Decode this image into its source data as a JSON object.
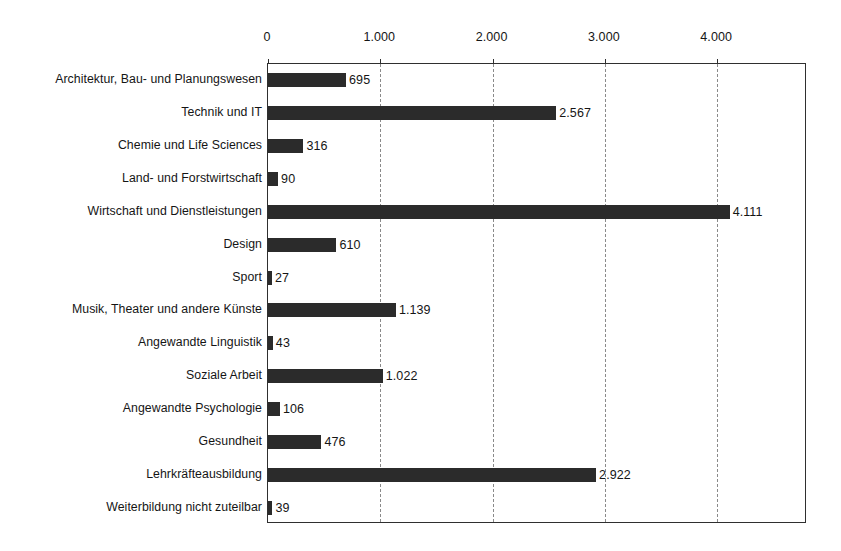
{
  "chart_data": {
    "type": "bar",
    "orientation": "horizontal",
    "title": "",
    "subtitle": "",
    "xlabel": "",
    "ylabel": "",
    "xlim": [
      0,
      4800
    ],
    "grid": "vertical-dashed",
    "legend": "none",
    "axis_position": "top",
    "number_format": "de-CH (thousands separator '.')",
    "xticks": [
      0,
      1000,
      2000,
      3000,
      4000
    ],
    "xtick_labels": [
      "0",
      "1.000",
      "2.000",
      "3.000",
      "4.000"
    ],
    "categories": [
      "Architektur, Bau- und Planungswesen",
      "Technik und IT",
      "Chemie und Life Sciences",
      "Land- und Forstwirtschaft",
      "Wirtschaft und Dienstleistungen",
      "Design",
      "Sport",
      "Musik, Theater und andere Künste",
      "Angewandte Linguistik",
      "Soziale Arbeit",
      "Angewandte Psychologie",
      "Gesundheit",
      "Lehrkräfteausbildung",
      "Weiterbildung nicht zuteilbar"
    ],
    "values": [
      695,
      2567,
      316,
      90,
      4111,
      610,
      27,
      1139,
      43,
      1022,
      106,
      476,
      2922,
      39
    ],
    "value_labels": [
      "695",
      "2.567",
      "316",
      "90",
      "4.111",
      "610",
      "27",
      "1.139",
      "43",
      "1.022",
      "106",
      "476",
      "2.922",
      "39"
    ],
    "series": [
      {
        "name": "Anzahl",
        "values": [
          695,
          2567,
          316,
          90,
          4111,
          610,
          27,
          1139,
          43,
          1022,
          106,
          476,
          2922,
          39
        ]
      }
    ],
    "colors": {
      "bar": "#2b2b2b",
      "grid": "#8a8a8a",
      "frame": "#2f2f2f",
      "text": "#151515",
      "background": "#ffffff"
    }
  }
}
